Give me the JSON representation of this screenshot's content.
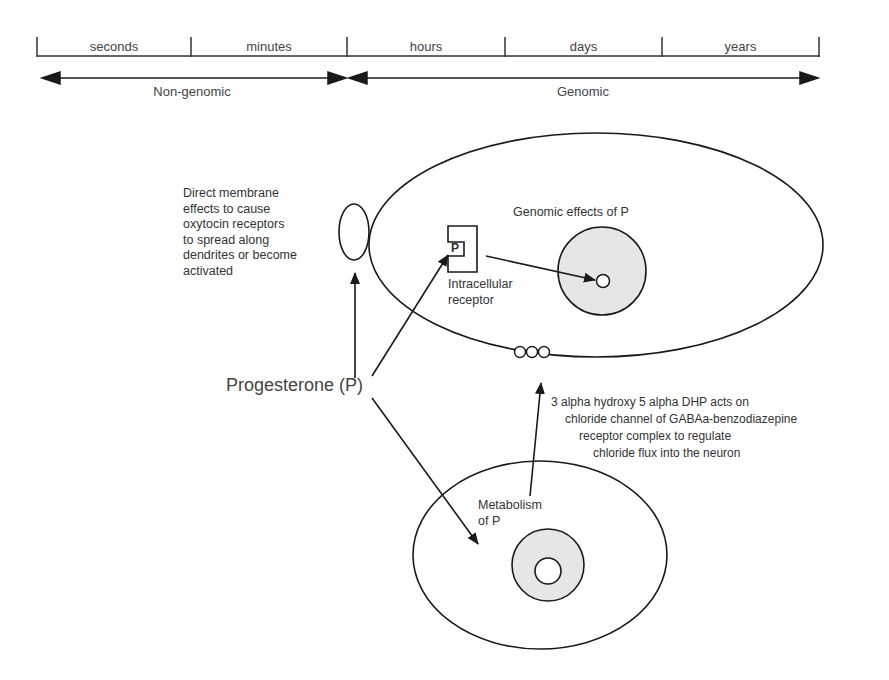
{
  "timescale": {
    "segments": [
      "seconds",
      "minutes",
      "hours",
      "days",
      "years"
    ],
    "ranges": [
      {
        "label": "Non-genomic",
        "from": "seconds",
        "to": "minutes"
      },
      {
        "label": "Genomic",
        "from": "hours",
        "to": "years"
      }
    ]
  },
  "labels": {
    "direct_membrane": "Direct membrane\neffects to cause\noxytocin receptors\nto spread along\ndendrites or become\nactivated",
    "genomic_effects": "Genomic effects of P",
    "receptor_letter": "P",
    "intracellular_receptor": "Intracellular\nreceptor",
    "progesterone": "Progesterone (P)",
    "metabolism": "Metabolism\nof P",
    "dhp_line1": "3 alpha hydroxy 5 alpha DHP acts on",
    "dhp_line2": "chloride channel of GABAa-benzodiazepine",
    "dhp_line3": "receptor complex to regulate",
    "dhp_line4": "chloride flux into the neuron"
  },
  "colors": {
    "line": "#1a1a1a",
    "nucleus_fill": "#e6e6e6"
  }
}
